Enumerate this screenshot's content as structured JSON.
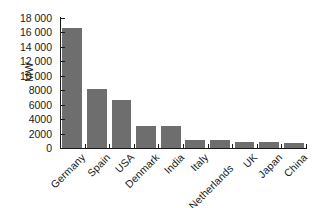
{
  "chart_data": {
    "type": "bar",
    "title": "",
    "xlabel": "",
    "ylabel": "MW",
    "categories": [
      "Germany",
      "Spain",
      "USA",
      "Denmark",
      "India",
      "Italy",
      "Netherlands",
      "UK",
      "Japan",
      "China"
    ],
    "values": [
      16600,
      8200,
      6700,
      3100,
      3000,
      1100,
      1050,
      900,
      900,
      750
    ],
    "ylim": [
      0,
      18000
    ],
    "ytick_values": [
      0,
      2000,
      4000,
      6000,
      8000,
      10000,
      12000,
      14000,
      16000,
      18000
    ],
    "ytick_labels": [
      "0",
      "2000",
      "4000",
      "6000",
      "8000",
      "10 000",
      "12 000",
      "14 000",
      "16 000",
      "18 000"
    ],
    "grid": false,
    "legend": false,
    "bar_color": "#6e6e6e",
    "axis_color": "#1a1a1a",
    "background": "#ffffff",
    "xlabel_rotation": -45
  }
}
